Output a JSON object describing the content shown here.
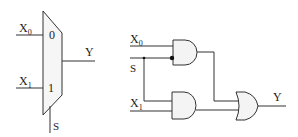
{
  "mux": {
    "input0_label": "X",
    "input0_sub": "0",
    "input1_label": "X",
    "input1_sub": "1",
    "port0": "0",
    "port1": "1",
    "output_label": "Y",
    "select_label": "S"
  },
  "gates": {
    "x0_label": "X",
    "x0_sub": "0",
    "s_label": "S",
    "x1_label": "X",
    "x1_sub": "1",
    "output_label": "Y"
  },
  "colors": {
    "stroke": "#333333",
    "fill": "#f4f4f4"
  }
}
